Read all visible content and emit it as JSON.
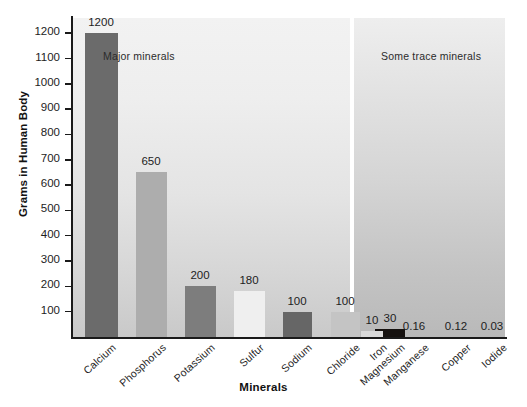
{
  "chart_data": {
    "type": "bar",
    "title": "",
    "xlabel": "Minerals",
    "ylabel": "Grams in Human Body",
    "categories": [
      "Calcium",
      "Phosphorus",
      "Potassium",
      "Sulfur",
      "Sodium",
      "Chloride",
      "Magnesium",
      "Iron",
      "Manganese",
      "Copper",
      "Iodide"
    ],
    "values": [
      1200,
      650,
      200,
      180,
      100,
      100,
      30,
      10,
      0.16,
      0.12,
      0.03
    ],
    "value_labels": [
      "1200",
      "650",
      "200",
      "180",
      "100",
      "100",
      "30",
      "10",
      "0.16",
      "0.12",
      "0.03"
    ],
    "ylim": [
      0,
      1260
    ],
    "yticks": [
      100,
      200,
      300,
      400,
      500,
      600,
      700,
      800,
      900,
      1000,
      1100,
      1200
    ],
    "ytick_labels": [
      "100",
      "200",
      "300",
      "400",
      "500",
      "600",
      "700",
      "800",
      "900",
      "1000",
      "1100",
      "1200"
    ],
    "grid": false,
    "legend": "none",
    "annotations": [
      {
        "text": "Major minerals",
        "group": "major"
      },
      {
        "text": "Some trace minerals",
        "group": "trace"
      }
    ],
    "groups": [
      {
        "name": "Major minerals",
        "categories": [
          "Calcium",
          "Phosphorus",
          "Potassium",
          "Sulfur",
          "Sodium",
          "Chloride",
          "Magnesium"
        ]
      },
      {
        "name": "Some trace minerals",
        "categories": [
          "Iron",
          "Manganese",
          "Copper",
          "Iodide"
        ]
      }
    ],
    "bar_colors": [
      "#6b6b6b",
      "#adadad",
      "#7d7d7d",
      "#efefef",
      "#666666",
      "#c4c4c4",
      "#15110f",
      "#d8d8d8",
      "#cfcfcf",
      "#cfcfcf",
      "#cfcfcf"
    ]
  },
  "sections": {
    "major_label": "Major minerals",
    "trace_label": "Some trace minerals"
  },
  "axes": {
    "y_title": "Grams in Human Body",
    "x_title": "Minerals"
  },
  "colors": {
    "axis": "#1a1a1a",
    "text": "#1d1d1d",
    "panel_major_top": "#f2f2f2",
    "panel_major_bottom": "#c9c9c9",
    "panel_trace_top": "#eeeeee",
    "panel_trace_bottom": "#b9b9b9"
  }
}
